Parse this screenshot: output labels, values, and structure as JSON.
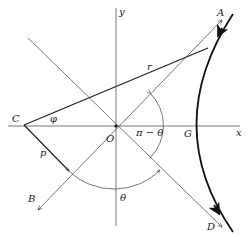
{
  "diagram": {
    "type": "hyperbolic-orbit-geometry",
    "colors": {
      "ink": "#222222",
      "background": "#ffffff",
      "thin_line": "#555555"
    },
    "labels": {
      "y_axis": "y",
      "x_axis": "x",
      "origin": "O",
      "point_A": "A",
      "point_B": "B",
      "point_C": "C",
      "point_D": "D",
      "point_G": "G",
      "radius": "r",
      "perpendicular": "p",
      "angle_phi": "φ",
      "angle_theta": "θ",
      "angle_pi_minus_theta": "π − θ"
    },
    "elements": [
      {
        "name": "x-axis",
        "from": "C side",
        "to": "x"
      },
      {
        "name": "y-axis",
        "from": "bottom",
        "to": "y"
      },
      {
        "name": "asymptote-OA-OB",
        "through": "O",
        "ends": [
          "A",
          "B"
        ]
      },
      {
        "name": "asymptote-OD",
        "through": "O",
        "ends": [
          "upper-left",
          "D"
        ]
      },
      {
        "name": "radius-vector",
        "from": "C",
        "label": "r"
      },
      {
        "name": "perpendicular",
        "from": "C",
        "label": "p",
        "to": "line OB"
      },
      {
        "name": "hyperbola-branch",
        "vertex": "G",
        "direction": "A to D"
      },
      {
        "name": "angle-arc-theta",
        "label": "θ"
      },
      {
        "name": "angle-arc-pi-minus-theta",
        "label": "π − θ"
      }
    ]
  }
}
